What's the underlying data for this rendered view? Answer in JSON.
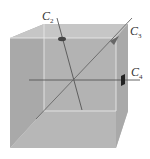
{
  "diagram": {
    "type": "cube-symmetry-axes",
    "colors": {
      "background": "#ffffff",
      "left_face": "#a8a8a8",
      "back_face": "#b4b4b4",
      "top_face": "#c4c4c4",
      "bottom_face": "#bdbdbd",
      "right_face": "#b0b0b0",
      "edge": "#e6e6e6",
      "axis": "#555555",
      "marker": "#333333"
    },
    "axes": [
      {
        "id": "C2",
        "letter": "C",
        "subscript": "2",
        "marker": "ellipse"
      },
      {
        "id": "C3",
        "letter": "C",
        "subscript": "3",
        "marker": "triangle"
      },
      {
        "id": "C4",
        "letter": "C",
        "subscript": "4",
        "marker": "square"
      }
    ]
  }
}
